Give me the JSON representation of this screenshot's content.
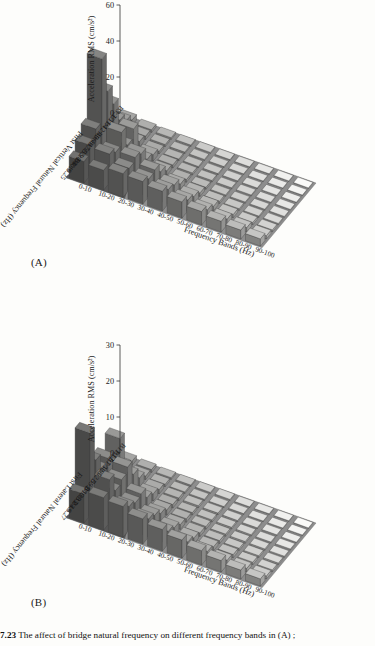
{
  "figure": {
    "caption_number": "7.23",
    "caption_text": "The affect of bridge natural frequency on different frequency bands in (A) ;"
  },
  "panels": [
    {
      "tag": "(A)",
      "id": "panel-a",
      "chart_data": {
        "type": "bar",
        "subtype": "bar3d",
        "title": "",
        "zlabel": "Acceleration RMS (cm/s²)",
        "xlabel": "First Vertical Natural Frequency (Hz)",
        "ylabel": "Frequency Bands (Hz)",
        "zlim": [
          0,
          60
        ],
        "zticks": [
          0,
          20,
          40,
          60
        ],
        "grid": false,
        "legend": "none",
        "categories_x": [
          "B3:3.5",
          "B11:4",
          "B12:4",
          "B9:4",
          "B6:4.5",
          "B7:5.9",
          "B5:8.8",
          "B10:9",
          "B4:10.25"
        ],
        "categories_y": [
          "0-10",
          "10-20",
          "20-30",
          "30-40",
          "40-50",
          "50-60",
          "60-70",
          "70-80",
          "80-90",
          "90-100"
        ],
        "series": [
          {
            "name": "B3:3.5",
            "values": [
              3.0,
              1.5,
              1.0,
              0.8,
              0.6,
              0.5,
              0.4,
              0.4,
              0.3,
              0.3
            ]
          },
          {
            "name": "B11:4",
            "values": [
              6.5,
              2.0,
              1.2,
              0.9,
              0.7,
              0.6,
              0.5,
              0.4,
              0.4,
              0.3
            ]
          },
          {
            "name": "B12:4",
            "values": [
              11.0,
              3.0,
              1.5,
              1.0,
              0.8,
              0.7,
              0.6,
              0.5,
              0.4,
              0.4
            ]
          },
          {
            "name": "B9:4",
            "values": [
              24.0,
              14.0,
              3.5,
              1.8,
              1.2,
              0.9,
              0.7,
              0.6,
              0.5,
              0.4
            ]
          },
          {
            "name": "B6:4.5",
            "values": [
              35.0,
              9.0,
              5.0,
              2.5,
              1.5,
              1.1,
              0.8,
              0.7,
              0.6,
              0.5
            ]
          },
          {
            "name": "B7:5.9",
            "values": [
              57.0,
              20.0,
              12.0,
              6.0,
              3.0,
              2.0,
              1.3,
              1.0,
              0.8,
              0.6
            ]
          },
          {
            "name": "B5:8.8",
            "values": [
              22.0,
              13.0,
              14.0,
              11.0,
              6.5,
              4.0,
              2.5,
              1.8,
              1.3,
              1.0
            ]
          },
          {
            "name": "B10:9",
            "values": [
              17.0,
              16.0,
              12.0,
              10.0,
              8.0,
              6.0,
              4.5,
              3.2,
              2.4,
              1.8
            ]
          },
          {
            "name": "B4:10.25",
            "values": [
              12.0,
              11.0,
              13.0,
              12.5,
              11.0,
              9.0,
              7.5,
              6.0,
              5.0,
              4.0
            ]
          }
        ]
      }
    },
    {
      "tag": "(B)",
      "id": "panel-b",
      "chart_data": {
        "type": "bar",
        "subtype": "bar3d",
        "title": "",
        "zlabel": "Acceleration RMS (cm/s²)",
        "xlabel": "First Lateral Natural Frequency (Hz)",
        "ylabel": "Frequency Bands (Hz)",
        "zlim": [
          0,
          30
        ],
        "zticks": [
          0,
          10,
          20,
          30
        ],
        "grid": false,
        "legend": "none",
        "categories_x": [
          "B11:1.5",
          "B12:1.5",
          "B7:1.95",
          "B3:2.5",
          "B9:3",
          "B6:3",
          "B10:3.2",
          "B5:3.9",
          "B4:6.27"
        ],
        "categories_y": [
          "0-10",
          "10-20",
          "20-30",
          "30-40",
          "40-50",
          "50-60",
          "60-70",
          "70-80",
          "80-90",
          "90-100"
        ],
        "series": [
          {
            "name": "B11:1.5",
            "values": [
              1.2,
              0.8,
              0.5,
              0.4,
              0.3,
              0.3,
              0.2,
              0.2,
              0.2,
              0.1
            ]
          },
          {
            "name": "B12:1.5",
            "values": [
              2.0,
              1.0,
              0.7,
              0.5,
              0.4,
              0.3,
              0.3,
              0.2,
              0.2,
              0.2
            ]
          },
          {
            "name": "B7:1.95",
            "values": [
              11.5,
              2.5,
              1.2,
              0.8,
              0.6,
              0.5,
              0.4,
              0.3,
              0.3,
              0.2
            ]
          },
          {
            "name": "B3:2.5",
            "values": [
              6.0,
              5.5,
              2.0,
              1.0,
              0.7,
              0.6,
              0.5,
              0.4,
              0.3,
              0.3
            ]
          },
          {
            "name": "B9:3",
            "values": [
              10.0,
              9.5,
              3.0,
              1.5,
              1.0,
              0.8,
              0.6,
              0.5,
              0.4,
              0.3
            ]
          },
          {
            "name": "B6:3",
            "values": [
              9.0,
              8.0,
              6.0,
              2.5,
              1.4,
              1.0,
              0.8,
              0.6,
              0.5,
              0.4
            ]
          },
          {
            "name": "B10:3.2",
            "values": [
              13.5,
              7.0,
              5.5,
              4.0,
              2.5,
              1.6,
              1.1,
              0.9,
              0.7,
              0.5
            ]
          },
          {
            "name": "B5:3.9",
            "values": [
              23.0,
              12.0,
              6.5,
              5.0,
              3.5,
              2.5,
              1.8,
              1.3,
              1.0,
              0.8
            ]
          },
          {
            "name": "B4:6.27",
            "values": [
              8.0,
              9.0,
              8.5,
              7.0,
              6.0,
              5.0,
              4.0,
              3.2,
              2.5,
              2.0
            ]
          }
        ]
      }
    }
  ]
}
